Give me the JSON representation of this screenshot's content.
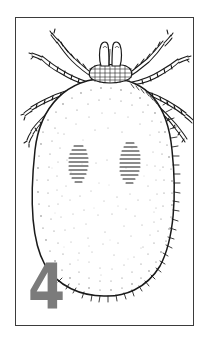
{
  "plate": {
    "figure_number": "4",
    "figure_number_color": "#7b7b7b",
    "frame_color": "#3b3b3b",
    "background_color": "#ffffff",
    "ink_color": "#1a1a1a"
  },
  "illustration": {
    "subject": "engorged female tick, dorsal view",
    "style": "stippled pen-and-ink line drawing",
    "parts": [
      {
        "name": "capitulum",
        "label": "capitulum"
      },
      {
        "name": "palps",
        "label": "palps"
      },
      {
        "name": "basis-capituli",
        "label": "basis capituli"
      },
      {
        "name": "idiosoma",
        "label": "idiosoma"
      },
      {
        "name": "cervical-groove-left",
        "label": "left cervical groove"
      },
      {
        "name": "cervical-groove-right",
        "label": "right cervical groove"
      },
      {
        "name": "festoons",
        "label": "festoons"
      },
      {
        "name": "legs",
        "label": "legs",
        "count": 8
      }
    ]
  }
}
